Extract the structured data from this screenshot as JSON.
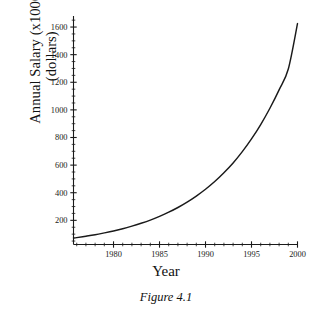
{
  "figure": {
    "caption": "Figure 4.1",
    "xlabel": "Year",
    "ylabel_line1": "Annual Salary (x1000)",
    "ylabel_line2": "(dollars)",
    "line_color": "#1a1a1a",
    "background": "#ffffff"
  },
  "chart_data": {
    "type": "line",
    "title": "",
    "subtitle": "",
    "caption": "Figure 4.1",
    "xlabel": "Year",
    "ylabel": "Annual Salary (x1000) (dollars)",
    "xlim": [
      1975.65,
      2000
    ],
    "ylim": [
      25,
      1680
    ],
    "grid": false,
    "legend": null,
    "x_major_ticks": [
      1980,
      1985,
      1990,
      1995,
      2000
    ],
    "x_major_tick_labels": [
      "1980",
      "1985",
      "1990",
      "1995",
      "2000"
    ],
    "x_minor_tick_interval": 1,
    "y_major_ticks": [
      200,
      400,
      600,
      800,
      1000,
      1200,
      1400,
      1600
    ],
    "y_major_tick_labels": [
      "200",
      "400",
      "600",
      "800",
      "1000",
      "1200",
      "1400",
      "1600"
    ],
    "y_minor_tick_interval": 50,
    "series": [
      {
        "name": "Annual Salary",
        "x": [
          1975.65,
          1976,
          1977,
          1978,
          1979,
          1980,
          1981,
          1982,
          1983,
          1984,
          1985,
          1986,
          1987,
          1988,
          1989,
          1990,
          1991,
          1992,
          1993,
          1994,
          1995,
          1996,
          1997,
          1998,
          1999,
          2000
        ],
        "values": [
          72,
          75,
          85,
          96,
          109,
          123,
          139,
          158,
          179,
          202,
          229,
          259,
          293,
          332,
          376,
          425,
          481,
          545,
          616,
          698,
          790,
          894,
          1012,
          1145,
          1296,
          1625
        ]
      }
    ]
  }
}
